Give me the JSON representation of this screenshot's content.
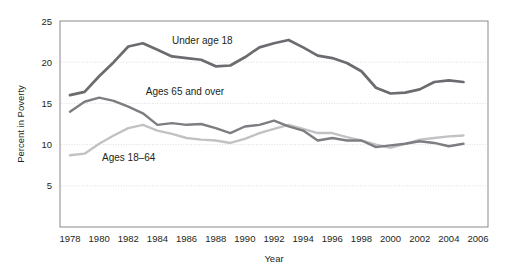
{
  "chart_data": {
    "type": "line",
    "title": "",
    "xlabel": "Year",
    "ylabel": "Percent in Poverty",
    "xlim": [
      1978,
      2006
    ],
    "ylim": [
      0,
      25
    ],
    "yticks": [
      5,
      10,
      15,
      20,
      25
    ],
    "ytick_labels": [
      "5",
      "10",
      "15",
      "20",
      "25"
    ],
    "xticks": [
      1978,
      1980,
      1982,
      1984,
      1986,
      1988,
      1990,
      1992,
      1994,
      1996,
      1998,
      2000,
      2002,
      2004,
      2006
    ],
    "xtick_labels": [
      "1978",
      "1980",
      "1982",
      "1984",
      "1986",
      "1988",
      "1990",
      "1992",
      "1994",
      "1996",
      "1998",
      "2000",
      "2002",
      "2004",
      "2006"
    ],
    "grid": true,
    "grid_axis": "y",
    "legend": "inline-annotations",
    "x": [
      1978,
      1979,
      1980,
      1981,
      1982,
      1983,
      1984,
      1985,
      1986,
      1987,
      1988,
      1989,
      1990,
      1991,
      1992,
      1993,
      1994,
      1995,
      1996,
      1997,
      1998,
      1999,
      2000,
      2001,
      2002,
      2003,
      2004,
      2005
    ],
    "series": [
      {
        "name": "Under age 18",
        "color": "#6b6b70",
        "label_x": 1985.0,
        "label_y": 22.6,
        "values": [
          16.0,
          16.4,
          18.3,
          20.0,
          21.9,
          22.3,
          21.5,
          20.7,
          20.5,
          20.3,
          19.5,
          19.6,
          20.6,
          21.8,
          22.3,
          22.7,
          21.8,
          20.8,
          20.5,
          19.9,
          18.9,
          16.9,
          16.2,
          16.3,
          16.7,
          17.6,
          17.8,
          17.6
        ]
      },
      {
        "name": "Ages 65 and over",
        "color": "#7d7d82",
        "label_x": 1983.2,
        "label_y": 16.4,
        "values": [
          14.0,
          15.2,
          15.7,
          15.3,
          14.6,
          13.8,
          12.4,
          12.6,
          12.4,
          12.5,
          12.0,
          11.4,
          12.2,
          12.4,
          12.9,
          12.2,
          11.7,
          10.5,
          10.8,
          10.5,
          10.5,
          9.7,
          9.9,
          10.1,
          10.4,
          10.2,
          9.8,
          10.1
        ]
      },
      {
        "name": "Ages 18–64",
        "color": "#c2c2c4",
        "label_x": 1980.2,
        "label_y": 8.4,
        "values": [
          8.7,
          8.9,
          10.1,
          11.1,
          12.0,
          12.4,
          11.7,
          11.3,
          10.8,
          10.6,
          10.5,
          10.2,
          10.7,
          11.4,
          11.9,
          12.4,
          11.9,
          11.4,
          11.4,
          10.9,
          10.5,
          10.0,
          9.6,
          10.1,
          10.6,
          10.8,
          11.0,
          11.1
        ]
      }
    ]
  },
  "geometry": {
    "plot_left": 60,
    "plot_right": 488,
    "plot_top": 21,
    "plot_bottom": 227
  }
}
